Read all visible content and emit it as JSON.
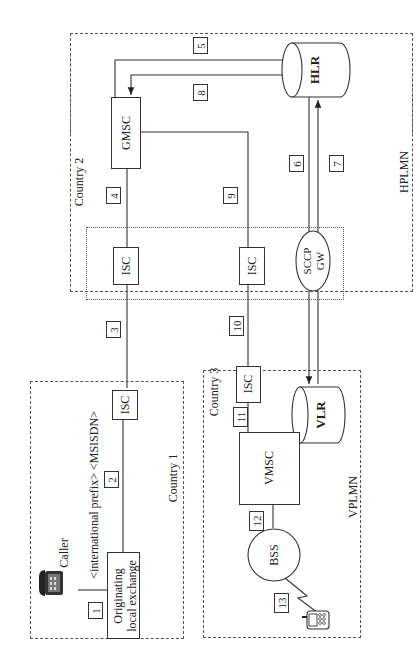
{
  "diagram": {
    "orientation": "rotated-90-ccw",
    "regions": {
      "country1": {
        "label": "Country 1"
      },
      "country2": {
        "label": "Country 2",
        "network": "HPLMN"
      },
      "country3": {
        "label": "Country 3",
        "network": "VPLMN"
      }
    },
    "nodes": {
      "caller": "Caller",
      "originating_line1": "Originating",
      "originating_line2": "local exchange",
      "isc_c1": "ISC",
      "isc_c2a": "ISC",
      "isc_c2b": "ISC",
      "isc_c3": "ISC",
      "gmsc": "GMSC",
      "hlr": "HLR",
      "sccp_line1": "SCCP",
      "sccp_line2": "GW",
      "vmsc": "VMSC",
      "vlr": "VLR",
      "bss": "BSS"
    },
    "dialed_number": "<international prefix> <MSISDN>",
    "steps": [
      "1",
      "2",
      "3",
      "4",
      "5",
      "6",
      "7",
      "8",
      "9",
      "10",
      "11",
      "12",
      "13"
    ]
  }
}
